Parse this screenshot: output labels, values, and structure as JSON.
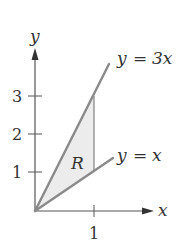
{
  "figure": {
    "axes": {
      "x_label": "x",
      "y_label": "y",
      "x_ticks": [
        {
          "value": 1,
          "label": "1"
        }
      ],
      "y_ticks": [
        {
          "value": 1,
          "label": "1"
        },
        {
          "value": 2,
          "label": "2"
        },
        {
          "value": 3,
          "label": "3"
        }
      ]
    },
    "curves": [
      {
        "equation": "y = 3x",
        "label_lhs": "y",
        "label_eq": "=",
        "label_rhs": "3x"
      },
      {
        "equation": "y = x",
        "label_lhs": "y",
        "label_eq": "=",
        "label_rhs": "x"
      }
    ],
    "region": {
      "label": "R",
      "bounded_by": [
        "y = 3x",
        "y = x",
        "x = 1"
      ]
    },
    "colors": {
      "line": "#8a8a8a",
      "axis": "#555555",
      "fill": "#ececec",
      "text": "#333333"
    }
  }
}
